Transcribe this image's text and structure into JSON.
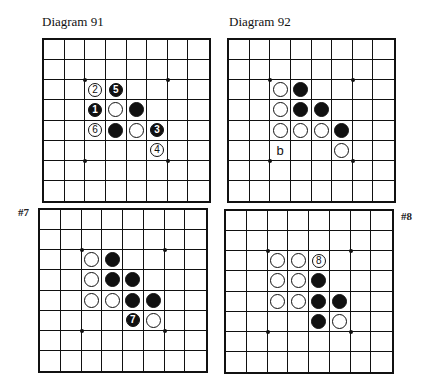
{
  "diagrams": [
    {
      "id": "d91",
      "title": "Diagram 91",
      "side_label": "",
      "pos": {
        "board_x": 42,
        "board_y": 38,
        "size_w": 169,
        "size_h": 165,
        "title_x": 42,
        "title_y": 14
      },
      "stones": [
        {
          "row": 2,
          "col": 2,
          "color": "white",
          "label": "2"
        },
        {
          "row": 2,
          "col": 3,
          "color": "black",
          "label": "5"
        },
        {
          "row": 3,
          "col": 2,
          "color": "black",
          "label": "1"
        },
        {
          "row": 3,
          "col": 3,
          "color": "white",
          "label": ""
        },
        {
          "row": 3,
          "col": 4,
          "color": "black",
          "label": ""
        },
        {
          "row": 4,
          "col": 2,
          "color": "white",
          "label": "6"
        },
        {
          "row": 4,
          "col": 3,
          "color": "black",
          "label": ""
        },
        {
          "row": 4,
          "col": 4,
          "color": "white",
          "label": ""
        },
        {
          "row": 4,
          "col": 5,
          "color": "black",
          "label": "3"
        },
        {
          "row": 5,
          "col": 5,
          "color": "white",
          "label": "4"
        }
      ],
      "markers": []
    },
    {
      "id": "d92",
      "title": "Diagram 92",
      "side_label": "",
      "pos": {
        "board_x": 227,
        "board_y": 38,
        "size_w": 169,
        "size_h": 165,
        "title_x": 229,
        "title_y": 14
      },
      "stones": [
        {
          "row": 2,
          "col": 2,
          "color": "white",
          "label": ""
        },
        {
          "row": 2,
          "col": 3,
          "color": "black",
          "label": ""
        },
        {
          "row": 3,
          "col": 2,
          "color": "white",
          "label": ""
        },
        {
          "row": 3,
          "col": 3,
          "color": "black",
          "label": ""
        },
        {
          "row": 3,
          "col": 4,
          "color": "black",
          "label": ""
        },
        {
          "row": 4,
          "col": 2,
          "color": "white",
          "label": ""
        },
        {
          "row": 4,
          "col": 3,
          "color": "white",
          "label": ""
        },
        {
          "row": 4,
          "col": 4,
          "color": "white",
          "label": ""
        },
        {
          "row": 4,
          "col": 5,
          "color": "black",
          "label": ""
        },
        {
          "row": 5,
          "col": 5,
          "color": "white",
          "label": ""
        }
      ],
      "markers": [
        {
          "row": 5,
          "col": 2,
          "text": "b"
        }
      ]
    },
    {
      "id": "d7",
      "title": "",
      "side_label": "#7",
      "pos": {
        "board_x": 38,
        "board_y": 208,
        "size_w": 170,
        "size_h": 165,
        "label_x": 18,
        "label_y": 206
      },
      "stones": [
        {
          "row": 2,
          "col": 2,
          "color": "white",
          "label": ""
        },
        {
          "row": 2,
          "col": 3,
          "color": "black",
          "label": ""
        },
        {
          "row": 3,
          "col": 2,
          "color": "white",
          "label": ""
        },
        {
          "row": 3,
          "col": 3,
          "color": "black",
          "label": ""
        },
        {
          "row": 3,
          "col": 4,
          "color": "black",
          "label": ""
        },
        {
          "row": 4,
          "col": 2,
          "color": "white",
          "label": ""
        },
        {
          "row": 4,
          "col": 3,
          "color": "white",
          "label": ""
        },
        {
          "row": 4,
          "col": 4,
          "color": "black",
          "label": ""
        },
        {
          "row": 4,
          "col": 5,
          "color": "black",
          "label": ""
        },
        {
          "row": 5,
          "col": 4,
          "color": "black",
          "label": "7"
        },
        {
          "row": 5,
          "col": 5,
          "color": "white",
          "label": ""
        }
      ],
      "markers": []
    },
    {
      "id": "d8",
      "title": "",
      "side_label": "#8",
      "pos": {
        "board_x": 224,
        "board_y": 209,
        "size_w": 170,
        "size_h": 165,
        "label_x": 401,
        "label_y": 210
      },
      "stones": [
        {
          "row": 2,
          "col": 2,
          "color": "white",
          "label": ""
        },
        {
          "row": 2,
          "col": 3,
          "color": "white",
          "label": ""
        },
        {
          "row": 2,
          "col": 4,
          "color": "white",
          "label": "8"
        },
        {
          "row": 3,
          "col": 2,
          "color": "white",
          "label": ""
        },
        {
          "row": 3,
          "col": 3,
          "color": "white",
          "label": ""
        },
        {
          "row": 3,
          "col": 4,
          "color": "black",
          "label": ""
        },
        {
          "row": 4,
          "col": 2,
          "color": "white",
          "label": ""
        },
        {
          "row": 4,
          "col": 3,
          "color": "white",
          "label": ""
        },
        {
          "row": 4,
          "col": 4,
          "color": "black",
          "label": ""
        },
        {
          "row": 4,
          "col": 5,
          "color": "black",
          "label": ""
        },
        {
          "row": 5,
          "col": 4,
          "color": "black",
          "label": ""
        },
        {
          "row": 5,
          "col": 5,
          "color": "white",
          "label": ""
        }
      ],
      "markers": []
    }
  ],
  "board": {
    "rows": 8,
    "cols": 8,
    "star_points": [
      [
        2,
        2
      ],
      [
        2,
        6
      ],
      [
        6,
        2
      ],
      [
        6,
        6
      ]
    ]
  },
  "colors": {
    "line": "#111111",
    "black_stone": "#111111",
    "white_stone": "#ffffff",
    "background": "#ffffff"
  }
}
